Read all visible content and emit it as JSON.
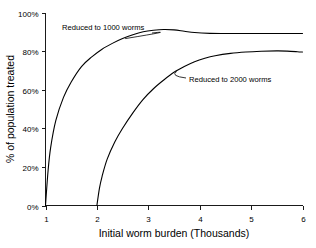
{
  "chart_data": {
    "type": "line",
    "title": "",
    "xlabel": "Initial worm burden (Thousands)",
    "ylabel": "% of population treated",
    "xlim": [
      1,
      6
    ],
    "ylim": [
      0,
      100
    ],
    "grid": false,
    "legend_position": "inline-annotations",
    "x_tick_labels": [
      "1",
      "2",
      "3",
      "4",
      "5",
      "6"
    ],
    "x_ticks": [
      1,
      2,
      3,
      4,
      5,
      6
    ],
    "y_tick_labels": [
      "0%",
      "20%",
      "40%",
      "60%",
      "80%",
      "100%"
    ],
    "y_ticks": [
      0,
      20,
      40,
      60,
      80,
      100
    ],
    "series": [
      {
        "name": "Reduced to 1000 worms",
        "x": [
          1.0,
          1.05,
          1.1,
          1.2,
          1.35,
          1.5,
          1.7,
          1.9,
          2.1,
          2.3,
          2.5,
          2.7,
          2.9,
          3.1,
          3.3,
          3.5,
          3.7,
          3.9,
          4.2,
          4.6,
          5.0,
          5.5,
          6.0
        ],
        "values": [
          0,
          18,
          30,
          44,
          56,
          64,
          72,
          77,
          81,
          84,
          86.5,
          88.5,
          90,
          90.8,
          91.2,
          91,
          90.3,
          89.6,
          89.2,
          89.1,
          89.1,
          89.1,
          89.1
        ]
      },
      {
        "name": "Reduced to 2000 worms",
        "x": [
          2.0,
          2.05,
          2.1,
          2.2,
          2.35,
          2.5,
          2.7,
          2.9,
          3.1,
          3.3,
          3.5,
          3.7,
          3.9,
          4.1,
          4.3,
          4.6,
          4.9,
          5.2,
          5.5,
          5.7,
          5.9,
          6.0
        ],
        "values": [
          0,
          9,
          15,
          24,
          33,
          40,
          48,
          55,
          60.5,
          65,
          69,
          72,
          74.5,
          76.3,
          77.6,
          78.8,
          79.5,
          79.9,
          80.1,
          80.0,
          79.7,
          79.5
        ]
      }
    ],
    "annotations": [
      {
        "label": "Reduced to 1000 worms",
        "target_x": 2.55,
        "target_y": 86.5
      },
      {
        "label": "Reduced to 2000 worms",
        "target_x": 3.55,
        "target_y": 69.5
      }
    ],
    "colors": {
      "line": "#000000",
      "axis": "#1a1a1a",
      "background": "#ffffff"
    }
  }
}
